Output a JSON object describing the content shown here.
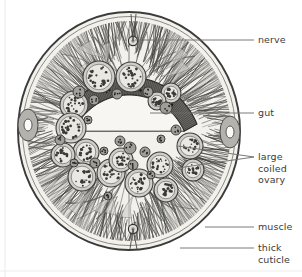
{
  "figure": {
    "background_color": "#ffffff",
    "body_fill": "#f2f1ec",
    "ink_color": "#3b3b3b",
    "muscle_fill": "#b9b8b2",
    "gut_wall_fill": "#6e6d68",
    "lumen_fill": "#f7f6f2",
    "ovary_fill": "#cfcec8",
    "leader_color": "#6b6b6b",
    "outline": {
      "center_x": 129,
      "center_y": 131,
      "radius_x": 111,
      "radius_y": 119
    }
  },
  "labels": [
    {
      "id": "nerve",
      "text": "nerve",
      "x": 258,
      "y": 34,
      "leader": {
        "x1": 135,
        "y1": 40,
        "x2": 254,
        "y2": 40
      },
      "lines": [
        "nerve"
      ]
    },
    {
      "id": "gut",
      "text": "gut",
      "x": 258,
      "y": 107,
      "leader": {
        "x1": 150,
        "y1": 113,
        "x2": 254,
        "y2": 113
      },
      "lines": [
        "gut"
      ]
    },
    {
      "id": "large-coiled-ovary",
      "text": "large coiled ovary",
      "x": 258,
      "y": 151,
      "leader": {
        "x1": 178,
        "y1": 146,
        "x2": 254,
        "y2": 157
      },
      "leader2": {
        "x1": 178,
        "y1": 168,
        "x2": 254,
        "y2": 157
      },
      "lines": [
        "large",
        "coiled",
        "ovary"
      ]
    },
    {
      "id": "muscle",
      "text": "muscle",
      "x": 258,
      "y": 221,
      "leader": {
        "x1": 205,
        "y1": 227,
        "x2": 254,
        "y2": 227
      },
      "lines": [
        "muscle"
      ]
    },
    {
      "id": "thick-cuticle",
      "text": "thick cuticle",
      "x": 258,
      "y": 242,
      "leader": {
        "x1": 180,
        "y1": 248,
        "x2": 254,
        "y2": 248
      },
      "lines": [
        "thick",
        "cuticle"
      ]
    }
  ],
  "structures": [
    {
      "id": "cuticle",
      "name": "thick cuticle",
      "description": "outermost dark ring"
    },
    {
      "id": "muscle-layer",
      "name": "muscle",
      "description": "hatched longitudinal muscle fields in four quadrants"
    },
    {
      "id": "gut",
      "name": "gut",
      "description": "crescent-shaped intestine with hatched wall and pale lumen"
    },
    {
      "id": "dorsal-nerve-cord",
      "name": "nerve",
      "description": "dorsal nerve cord at top midline"
    },
    {
      "id": "ventral-nerve-cord",
      "name": "nerve",
      "description": "ventral nerve cord at bottom midline"
    },
    {
      "id": "lateral-cord-left",
      "name": "lateral cord",
      "description": "left lateral cord with excretory canal"
    },
    {
      "id": "lateral-cord-right",
      "name": "lateral cord",
      "description": "right lateral cord with excretory canal"
    },
    {
      "id": "ovary-sections",
      "name": "large coiled ovary",
      "description": "numerous stippled circular ovary/oviduct profiles filling the pseudocoel"
    }
  ]
}
